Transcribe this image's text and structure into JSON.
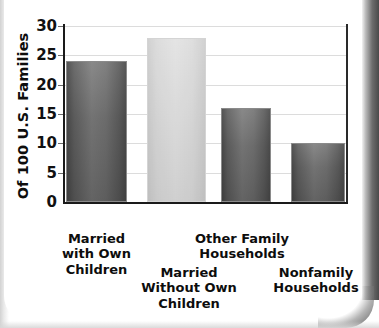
{
  "chart_data": {
    "type": "bar",
    "title": "",
    "subtitle": "",
    "xlabel": "",
    "ylabel": "Of 100 U.S. Families",
    "ylim": [
      0,
      30
    ],
    "ytick_labels": [
      "30",
      "25",
      "20",
      "15",
      "10",
      "5",
      "0"
    ],
    "ytick_values": [
      30,
      25,
      20,
      15,
      10,
      5,
      0
    ],
    "grid": true,
    "legend": "none",
    "categories": [
      "Married with Own Children",
      "Married Without Own Children",
      "Other Family Households",
      "Nonfamily Households"
    ],
    "category_lines": [
      [
        "Married",
        "with Own",
        "Children"
      ],
      [
        "Married",
        "Without Own",
        "Children"
      ],
      [
        "Other Family",
        "Households"
      ],
      [
        "Nonfamily",
        "Households"
      ]
    ],
    "values": [
      24,
      28,
      16,
      10
    ],
    "bar_colors": [
      "#a0a0a0",
      "#e9e9e9",
      "#a0a0a0",
      "#a0a0a0"
    ]
  },
  "axis": {
    "y_title": "Of 100 U.S. Families",
    "ticks": [
      {
        "label": "30",
        "value": 30
      },
      {
        "label": "25",
        "value": 25
      },
      {
        "label": "20",
        "value": 20
      },
      {
        "label": "15",
        "value": 15
      },
      {
        "label": "10",
        "value": 10
      },
      {
        "label": "5",
        "value": 5
      },
      {
        "label": "0",
        "value": 0
      }
    ]
  },
  "bars": [
    {
      "value": 24,
      "tone": "dark",
      "label_lines": [
        "Married",
        "with Own",
        "Children"
      ],
      "line1": "Married",
      "line2": "with Own",
      "line3": "Children"
    },
    {
      "value": 28,
      "tone": "light",
      "label_lines": [
        "Married",
        "Without Own",
        "Children"
      ],
      "line1": "Married",
      "line2": "Without Own",
      "line3": "Children"
    },
    {
      "value": 16,
      "tone": "dark",
      "label_lines": [
        "Other Family",
        "Households"
      ],
      "line1": "Other Family",
      "line2": "Households",
      "line3": ""
    },
    {
      "value": 10,
      "tone": "dark",
      "label_lines": [
        "Nonfamily",
        "Households"
      ],
      "line1": "Nonfamily",
      "line2": "Households",
      "line3": ""
    }
  ]
}
